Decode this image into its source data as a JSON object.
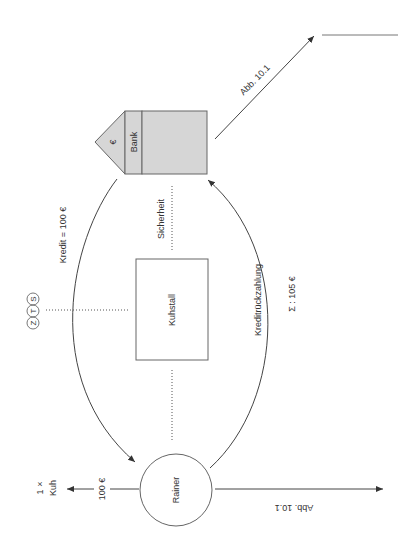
{
  "diagram": {
    "orientation": "rotated 90 degrees counter-clockwise",
    "nodes": {
      "bank": {
        "label": "Bank",
        "roof_symbol": "€",
        "fill": "#d4d4d4",
        "stroke": "#666666"
      },
      "kuhstall": {
        "label": "Kuhstall"
      },
      "rainer": {
        "label": "Rainer"
      }
    },
    "edges": {
      "kredit": {
        "label": "Kredit = 100 €"
      },
      "rueckzahlung": {
        "label": "Kreditrückzahlung",
        "sum_label": "Σ : 105 €"
      },
      "sicherheit": {
        "label": "Sicherheit"
      },
      "purchase": {
        "amount_label": "100 €",
        "target_line1": "1 ×",
        "target_line2": "Kuh"
      }
    },
    "zts": {
      "letters": [
        "Z",
        "T",
        "S"
      ]
    },
    "references": {
      "top_right": "Abb. 10.1",
      "bottom": "Abb. 10.1"
    },
    "colors": {
      "line": "#444444",
      "bank_fill": "#d6d6d6",
      "text": "#333333"
    }
  }
}
